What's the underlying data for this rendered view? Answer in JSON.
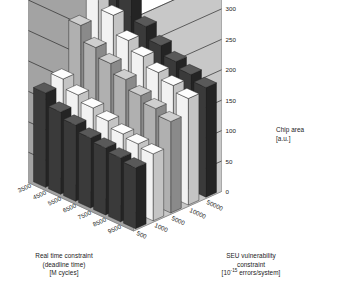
{
  "figure": {
    "type": "3d-bar-chart",
    "background_color": "#ffffff"
  },
  "axes": {
    "x": {
      "title_lines": [
        "Real time constraint",
        "(deadline time)",
        "[M cycles]"
      ],
      "ticks": [
        "3500",
        "4500",
        "5500",
        "6500",
        "7500",
        "8500",
        "9500"
      ],
      "unit": "M cycles"
    },
    "y": {
      "title_lines": [
        "SEU vulnerability",
        "constraint"
      ],
      "title_unit_prefix": "[10",
      "title_unit_sup": "-15",
      "title_unit_suffix": " errors/system]",
      "ticks": [
        "50000",
        "10000",
        "5000",
        "1000",
        "500"
      ]
    },
    "z": {
      "title_lines": [
        "Chip area",
        "[a.u.]"
      ],
      "ticks": [
        "0",
        "50",
        "100",
        "150",
        "200",
        "250",
        "300",
        "350"
      ],
      "range": [
        0,
        350
      ]
    }
  },
  "colors": {
    "wall_left": "#a3a3a3",
    "wall_right": "#c8c8c8",
    "floor": "#bdbdbd",
    "gridline": "#2b2b2b",
    "bar_dark_front": "#3a3a3a",
    "bar_dark_side": "#242424",
    "bar_dark_top": "#595959",
    "bar_light_front": "#f2f2f2",
    "bar_light_side": "#c4c4c4",
    "bar_light_top": "#fdfdfd",
    "bar_mid_front": "#b0b0b0",
    "bar_mid_side": "#8a8a8a",
    "bar_mid_top": "#cfcfcf",
    "text": "#1a1a1a"
  },
  "chart_data": {
    "type": "bar",
    "title": "",
    "xlabel": "Real time constraint (deadline time) [M cycles]",
    "ylabel": "SEU vulnerability constraint [10^-15 errors/system]",
    "zlabel": "Chip area [a.u.]",
    "zlim": [
      0,
      350
    ],
    "grid": true,
    "legend": "none",
    "x_categories": [
      "3500",
      "4500",
      "5500",
      "6500",
      "7500",
      "8500",
      "9500"
    ],
    "y_categories": [
      "50000",
      "10000",
      "5000",
      "1000",
      "500"
    ],
    "series": [
      {
        "name": "50000",
        "shade": "dark",
        "values": [
          330,
          290,
          235,
          215,
          200,
          190,
          180
        ]
      },
      {
        "name": "10000",
        "shade": "light",
        "values": [
          340,
          255,
          225,
          210,
          195,
          185,
          175
        ]
      },
      {
        "name": "5000",
        "shade": "mid",
        "values": [
          240,
          215,
          200,
          185,
          170,
          160,
          150
        ]
      },
      {
        "name": "1000",
        "shade": "light",
        "values": [
          165,
          150,
          140,
          130,
          120,
          115,
          110
        ]
      },
      {
        "name": "500",
        "shade": "dark",
        "values": [
          155,
          135,
          125,
          115,
          110,
          105,
          100
        ]
      }
    ]
  }
}
